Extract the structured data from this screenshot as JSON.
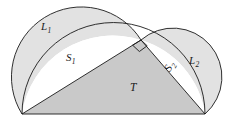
{
  "figure": {
    "width": 230,
    "height": 126,
    "background": "#ffffff",
    "stroke_color": "#1a1a1a",
    "stroke_width": 0.9,
    "colors": {
      "lune_fill": "#e2e2e2",
      "triangle_fill": "#c9c9c9",
      "segment_fill": "#ffffff",
      "outline": "#1a1a1a",
      "label_text": "#1a1a1a"
    },
    "labels": [
      {
        "id": "L1",
        "base": "L",
        "sub": "1",
        "role": "lune-left",
        "x": 41,
        "y": 21
      },
      {
        "id": "S1",
        "base": "S",
        "sub": "1",
        "role": "segment-left",
        "x": 66,
        "y": 52
      },
      {
        "id": "T",
        "base": "T",
        "sub": "",
        "role": "triangle",
        "x": 130,
        "y": 82
      },
      {
        "id": "L2",
        "base": "L",
        "sub": "2",
        "role": "lune-right",
        "x": 189,
        "y": 55
      },
      {
        "id": "S2",
        "base": "S",
        "sub": "2",
        "role": "segment-right",
        "x": 167,
        "y": 65
      }
    ],
    "geometry": {
      "vertex_left": {
        "x": 22,
        "y": 114
      },
      "vertex_right": {
        "x": 205,
        "y": 114
      },
      "vertex_apex": {
        "x": 141,
        "y": 40
      },
      "hypotenuse_center": {
        "x": 113.5,
        "y": 114
      },
      "hypotenuse_radius": 91.5,
      "leg1_center": {
        "x": 81.5,
        "y": 77
      },
      "leg1_radius": 52.5,
      "leg2_center": {
        "x": 173,
        "y": 77
      },
      "leg2_radius": 48.9,
      "right_angle_marker_size": 11
    }
  }
}
